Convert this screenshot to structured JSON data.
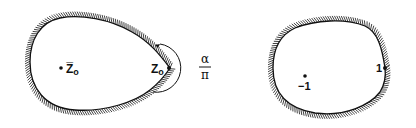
{
  "figure": {
    "left_domain": {
      "interior_point_label": "Z̅",
      "interior_point_subscript": "o",
      "corner_point_label": "Z",
      "corner_point_subscript": "o",
      "angle_label_numerator": "α",
      "angle_label_denominator": "π"
    },
    "right_domain": {
      "interior_point_label": "−1",
      "boundary_point_label": "1"
    },
    "colors": {
      "ink": "#111111",
      "background": "#ffffff"
    }
  }
}
